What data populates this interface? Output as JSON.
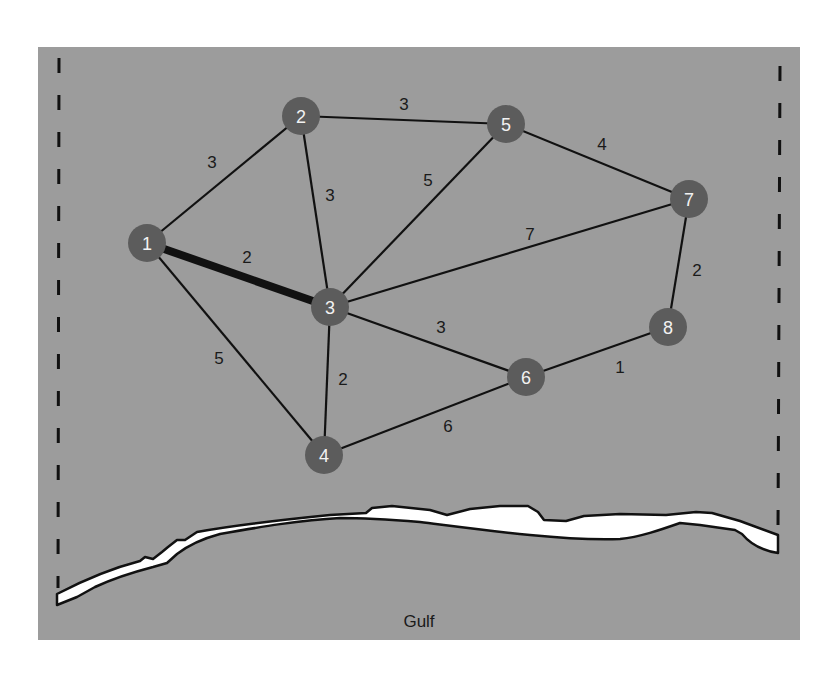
{
  "diagram": {
    "colors": {
      "panel": "#9c9c9c",
      "node_fill": "#5c5c5c",
      "node_text": "#f2f2f2",
      "edge": "#111111",
      "land_strip": "#ffffff",
      "label_text": "#1a1a1a"
    },
    "nodes": [
      {
        "id": "1",
        "label": "1",
        "x": 147,
        "y": 243
      },
      {
        "id": "2",
        "label": "2",
        "x": 301,
        "y": 116
      },
      {
        "id": "3",
        "label": "3",
        "x": 330,
        "y": 307
      },
      {
        "id": "4",
        "label": "4",
        "x": 324,
        "y": 455
      },
      {
        "id": "5",
        "label": "5",
        "x": 506,
        "y": 124
      },
      {
        "id": "6",
        "label": "6",
        "x": 526,
        "y": 377
      },
      {
        "id": "7",
        "label": "7",
        "x": 689,
        "y": 199
      },
      {
        "id": "8",
        "label": "8",
        "x": 668,
        "y": 327
      }
    ],
    "edges": [
      {
        "from": "1",
        "to": "2",
        "weight": "3",
        "lx": 212,
        "ly": 162,
        "highlighted": false
      },
      {
        "from": "1",
        "to": "3",
        "weight": "2",
        "lx": 247,
        "ly": 257,
        "highlighted": true
      },
      {
        "from": "1",
        "to": "4",
        "weight": "5",
        "lx": 219,
        "ly": 358,
        "highlighted": false
      },
      {
        "from": "2",
        "to": "3",
        "weight": "3",
        "lx": 330,
        "ly": 195,
        "highlighted": false
      },
      {
        "from": "2",
        "to": "5",
        "weight": "3",
        "lx": 404,
        "ly": 104,
        "highlighted": false
      },
      {
        "from": "3",
        "to": "5",
        "weight": "5",
        "lx": 428,
        "ly": 180,
        "highlighted": false
      },
      {
        "from": "3",
        "to": "7",
        "weight": "7",
        "lx": 530,
        "ly": 234,
        "highlighted": false
      },
      {
        "from": "3",
        "to": "6",
        "weight": "3",
        "lx": 441,
        "ly": 327,
        "highlighted": false
      },
      {
        "from": "3",
        "to": "4",
        "weight": "2",
        "lx": 343,
        "ly": 379,
        "highlighted": false
      },
      {
        "from": "5",
        "to": "7",
        "weight": "4",
        "lx": 602,
        "ly": 144,
        "highlighted": false
      },
      {
        "from": "7",
        "to": "8",
        "weight": "2",
        "lx": 697,
        "ly": 270,
        "highlighted": false
      },
      {
        "from": "6",
        "to": "8",
        "weight": "1",
        "lx": 620,
        "ly": 367,
        "highlighted": false
      },
      {
        "from": "4",
        "to": "6",
        "weight": "6",
        "lx": 448,
        "ly": 426,
        "highlighted": false
      }
    ],
    "water_label": "Gulf"
  }
}
